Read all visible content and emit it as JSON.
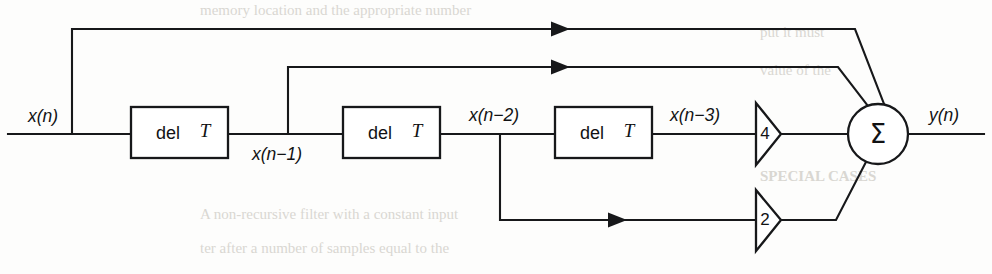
{
  "diagram": {
    "input_label": "x(n)",
    "output_label": "y(n)",
    "tap_labels": {
      "tap0": "x(n)",
      "tap1": "x(n−1)",
      "tap2": "x(n−2)",
      "tap3": "x(n−3)"
    },
    "delay_blocks": [
      {
        "id": "delay-1",
        "prefix": "del",
        "symbol": "T"
      },
      {
        "id": "delay-2",
        "prefix": "del",
        "symbol": "T"
      },
      {
        "id": "delay-3",
        "prefix": "del",
        "symbol": "T"
      }
    ],
    "gain_blocks": [
      {
        "id": "gain-4",
        "value": "4",
        "source": "x(n−3)"
      },
      {
        "id": "gain-2",
        "value": "2",
        "source": "x(n−2)"
      }
    ],
    "summer": {
      "id": "summing-junction",
      "symbol": "Σ"
    },
    "colors": {
      "line": "#17181a",
      "text": "#111214",
      "background": "#fdfdfc"
    }
  },
  "scan_text": {
    "top_line": "memory location and the appropriate number",
    "right_upper": "put it must",
    "right_mid": "value of the",
    "heading": "SPECIAL CASES",
    "body_line_1": "A non-recursive filter with a constant input",
    "body_line_2": "ter after a number of samples equal to the"
  }
}
